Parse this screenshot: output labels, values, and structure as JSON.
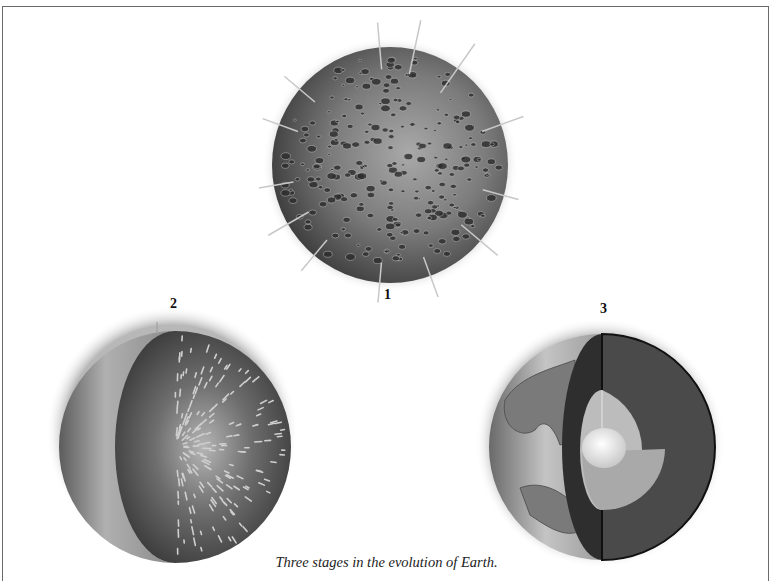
{
  "figure": {
    "caption": "Three stages in the evolution of Earth.",
    "stages": [
      {
        "number": "1",
        "description": "Cratered protoplanet under meteorite bombardment"
      },
      {
        "number": "2",
        "description": "Cutaway of homogeneous heated planet"
      },
      {
        "number": "3",
        "description": "Cutaway of differentiated Earth with crust, mantle, outer and inner core"
      }
    ]
  },
  "colors": {
    "sphere_dark": "#3a3a3a",
    "sphere_mid": "#7a7a7a",
    "sphere_light": "#bdbdbd",
    "core_light": "#f2f2f2"
  }
}
